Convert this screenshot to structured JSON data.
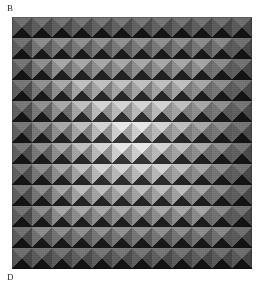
{
  "figure": {
    "kind": "op-art-halftone-plate",
    "caption_top": "B",
    "caption_bottom": "D",
    "background_color": "#ffffff",
    "plate": {
      "x": 12,
      "y": 17,
      "width": 240,
      "height": 252,
      "base_color": "#6e6e6e",
      "grid_columns": 12,
      "grid_rows": 12,
      "tile_width": 20,
      "tile_height": 21,
      "tile_shape": "square-split-into-four-triangles",
      "triangle_order": [
        "top",
        "right",
        "bottom",
        "left"
      ]
    },
    "palette": {
      "darkest": "#1a1a1a",
      "dark": "#2e2e2e",
      "mid_dark": "#4a4a4a",
      "mid": "#6b6b6b",
      "mid_light": "#8d8d8d",
      "light": "#ababab",
      "lighter": "#c6c6c6",
      "lightest": "#dedede",
      "highlight": "#ececec"
    },
    "shading_model": {
      "description": "Each cell is a four-sided pyramid lit from upper-left; ring index from the grid centre modulates overall lightness producing concentric diamond bands.",
      "light_direction": "upper-left",
      "top_face": "lightest",
      "left_face": "light",
      "right_face": "mid",
      "bottom_face": "darkest"
    },
    "ring_luminance": [
      0.95,
      0.62,
      0.86,
      0.5,
      0.8,
      0.44,
      0.74,
      0.4,
      0.68,
      0.34,
      0.6,
      0.28
    ],
    "rows": [
      [
        5,
        5,
        5,
        5,
        5,
        5,
        5,
        5,
        5,
        5,
        5,
        5
      ],
      [
        5,
        4,
        4,
        4,
        4,
        4,
        4,
        4,
        4,
        4,
        4,
        5
      ],
      [
        5,
        4,
        3,
        3,
        3,
        3,
        3,
        3,
        3,
        3,
        4,
        5
      ],
      [
        5,
        4,
        3,
        2,
        2,
        2,
        2,
        2,
        2,
        3,
        4,
        5
      ],
      [
        5,
        4,
        3,
        2,
        1,
        1,
        1,
        1,
        2,
        3,
        4,
        5
      ],
      [
        5,
        4,
        3,
        2,
        1,
        0,
        0,
        1,
        2,
        3,
        4,
        5
      ],
      [
        5,
        4,
        3,
        2,
        1,
        0,
        0,
        1,
        2,
        3,
        4,
        5
      ],
      [
        5,
        4,
        3,
        2,
        1,
        1,
        1,
        1,
        2,
        3,
        4,
        5
      ],
      [
        5,
        4,
        3,
        2,
        2,
        2,
        2,
        2,
        2,
        3,
        4,
        5
      ],
      [
        5,
        4,
        3,
        3,
        3,
        3,
        3,
        3,
        3,
        3,
        4,
        5
      ],
      [
        5,
        4,
        4,
        4,
        4,
        4,
        4,
        4,
        4,
        4,
        4,
        5
      ],
      [
        5,
        5,
        5,
        5,
        5,
        5,
        5,
        5,
        5,
        5,
        5,
        5
      ]
    ],
    "band_colors": {
      "top": [
        "#e6e6e6",
        "#d2d2d2",
        "#bdbdbd",
        "#a6a6a6",
        "#8f8f8f",
        "#787878"
      ],
      "left": [
        "#c9c9c9",
        "#b4b4b4",
        "#9f9f9f",
        "#8a8a8a",
        "#757575",
        "#616161"
      ],
      "right": [
        "#9a9a9a",
        "#8a8a8a",
        "#7a7a7a",
        "#6a6a6a",
        "#5b5b5b",
        "#4d4d4d"
      ],
      "bottom": [
        "#2a2a2a",
        "#252525",
        "#202020",
        "#1c1c1c",
        "#181818",
        "#141414"
      ]
    }
  }
}
